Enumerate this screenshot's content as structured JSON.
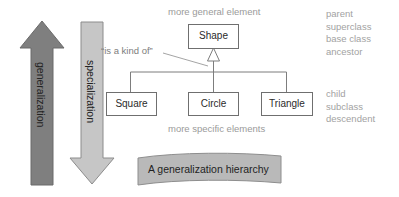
{
  "canvas": {
    "width": 399,
    "height": 197,
    "background": "#ffffff"
  },
  "colors": {
    "generalization_arrow": "#7f7f7f",
    "specialization_arrow": "#c6c6c6",
    "arrow_outline": "#6e6e6e",
    "box_stroke": "#6f6f6f",
    "box_fill": "#ffffff",
    "connector": "#7d7d7d",
    "caption_fill": "#b9b9b9",
    "caption_stroke": "#8e8e8e",
    "muted_text": "#9a9a9a",
    "dark_text": "#232323"
  },
  "arrows": {
    "generalization": {
      "label": "generalization",
      "direction": "up",
      "fill": "#7f7f7f"
    },
    "specialization": {
      "label": "specialization",
      "direction": "down",
      "fill": "#c6c6c6"
    }
  },
  "annotations": {
    "top_note": "more general element",
    "relation_note": "“is a kind of”",
    "bottom_note": "more specific elements"
  },
  "hierarchy": {
    "parent": {
      "label": "Shape"
    },
    "children": [
      {
        "label": "Square"
      },
      {
        "label": "Circle"
      },
      {
        "label": "Triangle"
      }
    ]
  },
  "terms": {
    "parent_terms": [
      "parent",
      "superclass",
      "base class",
      "ancestor"
    ],
    "child_terms": [
      "child",
      "subclass",
      "descendent"
    ]
  },
  "caption": {
    "text": "A generalization hierarchy"
  }
}
